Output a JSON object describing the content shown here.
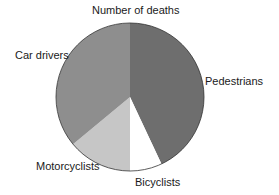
{
  "chart_data": {
    "type": "pie",
    "title": "Number of deaths",
    "categories": [
      "Pedestrians",
      "Bicyclists",
      "Motorcyclists",
      "Car drivers"
    ],
    "values": [
      43,
      7,
      14,
      36
    ],
    "unit": "percent (estimated from slice angles)",
    "colors": [
      "#6e6e6e",
      "#ffffff",
      "#c6c6c6",
      "#8e8e8e"
    ],
    "start_angle_deg": 0,
    "direction": "clockwise",
    "legend": "none (direct labels)"
  },
  "labels": {
    "title": "Number of deaths",
    "pedestrians": "Pedestrians",
    "bicyclists": "Bicyclists",
    "motorcyclists": "Motorcyclists",
    "car_drivers": "Car drivers"
  }
}
